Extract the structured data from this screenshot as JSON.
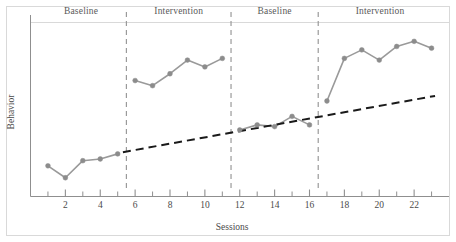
{
  "chart_data": {
    "type": "line",
    "title": "",
    "xlabel": "Sessions",
    "ylabel": "Behavior",
    "xlim": [
      0,
      24
    ],
    "ylim": [
      0,
      100
    ],
    "grid": false,
    "legend_position": "none",
    "x_tick_labels": [
      "2",
      "4",
      "6",
      "8",
      "10",
      "12",
      "14",
      "16",
      "18",
      "20",
      "22"
    ],
    "x_tick_values": [
      2,
      4,
      6,
      8,
      10,
      12,
      14,
      16,
      18,
      20,
      22
    ],
    "x_minor_tick_values": [
      1,
      3,
      5,
      7,
      9,
      11,
      13,
      15,
      17,
      19,
      21,
      23
    ],
    "y_tick_labels": [],
    "phase_labels": [
      "Baseline",
      "Intervention",
      "Baseline",
      "Intervention"
    ],
    "phase_boundaries": [
      5.5,
      11.5,
      16.5
    ],
    "series": [
      {
        "name": "Baseline 1",
        "phase": "Baseline",
        "x": [
          1,
          2,
          3,
          4,
          5
        ],
        "values": [
          18,
          11,
          21,
          22,
          25
        ]
      },
      {
        "name": "Intervention 1",
        "phase": "Intervention",
        "x": [
          6,
          7,
          8,
          9,
          10,
          11
        ],
        "values": [
          68,
          65,
          72,
          80,
          76,
          81
        ]
      },
      {
        "name": "Baseline 2",
        "phase": "Baseline",
        "x": [
          12,
          13,
          14,
          15,
          16
        ],
        "values": [
          39,
          42,
          41,
          47,
          42
        ]
      },
      {
        "name": "Intervention 2",
        "phase": "Intervention",
        "x": [
          17,
          18,
          19,
          20,
          21,
          22,
          23
        ],
        "values": [
          56,
          81,
          86,
          80,
          88,
          91,
          87
        ]
      }
    ],
    "trendline": {
      "name": "Trend",
      "style": "dashed",
      "x": [
        5.3,
        23.2
      ],
      "values": [
        26,
        59
      ]
    },
    "marker_color": "#8c8c8c",
    "line_color": "#9a9a9a",
    "trendline_color": "#1a1a1a",
    "axis_color": "#8f8f8f",
    "divider_color": "#9a9a9a",
    "frame_color": "#d9d9d9"
  }
}
